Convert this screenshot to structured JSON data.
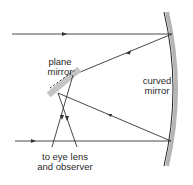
{
  "diagram": {
    "labels": {
      "plane_mirror_line1": "plane",
      "plane_mirror_line2": "mirror",
      "curved_mirror_line1": "curved",
      "curved_mirror_line2": "mirror",
      "observer_line1": "to eye lens",
      "observer_line2": "and observer"
    },
    "colors": {
      "ray": "#333333",
      "mirror_shadow": "#b5b5b5",
      "mirror_line": "#222222",
      "plane_mirror_fill": "#c4c4c4",
      "text": "#2a2a2a"
    },
    "elements": [
      {
        "id": "incoming-ray-top",
        "type": "ray",
        "direction": "right"
      },
      {
        "id": "incoming-ray-bottom",
        "type": "ray",
        "direction": "right"
      },
      {
        "id": "reflected-ray-top",
        "type": "ray",
        "direction": "left"
      },
      {
        "id": "reflected-ray-bottom",
        "type": "ray",
        "direction": "left"
      },
      {
        "id": "plane-mirror",
        "type": "mirror"
      },
      {
        "id": "curved-mirror",
        "type": "mirror"
      },
      {
        "id": "output-rays",
        "type": "ray",
        "direction": "down"
      }
    ]
  }
}
